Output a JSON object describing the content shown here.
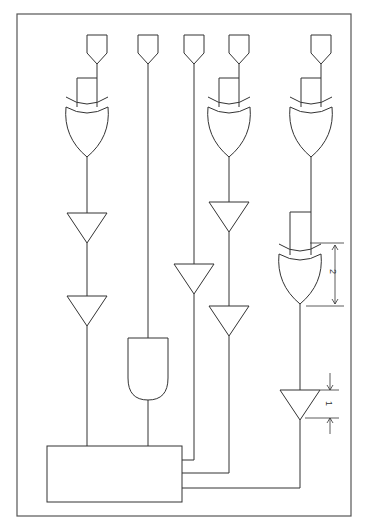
{
  "diagram": {
    "type": "logic-circuit-schematic",
    "components": {
      "input_pins": 5,
      "xor_gates": 4,
      "buffers": 6,
      "and_gates": 1,
      "output_block": 1
    },
    "dimension_labels": {
      "xor_height": "2",
      "buffer_height": "1"
    },
    "colors": {
      "stroke": "#333333",
      "background": "#ffffff"
    }
  }
}
